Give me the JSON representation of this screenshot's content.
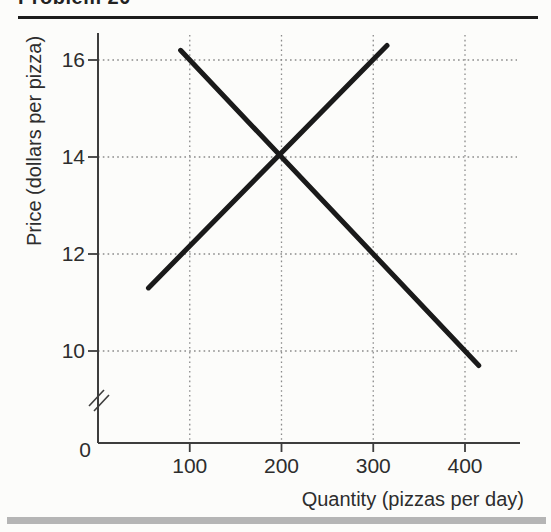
{
  "page": {
    "heading_clipped": "Problem 20",
    "top_rule_color": "#1c1c1c",
    "bottom_bar_color": "#b5b5b5",
    "background_color": "#fcfcfa"
  },
  "chart_data": {
    "type": "line",
    "title": "",
    "xlabel": "Quantity (pizzas per day)",
    "ylabel": "Price (dollars per pizza)",
    "x_ticks": [
      100,
      200,
      300,
      400
    ],
    "y_ticks": [
      16,
      14,
      12,
      10
    ],
    "origin_label": "0",
    "xlim": [
      0,
      455
    ],
    "ylim": [
      9,
      16.5
    ],
    "y_axis_break": true,
    "grid": "dotted",
    "grid_color": "#8a8a8a",
    "axis_color": "#3d3d3d",
    "line_color": "#1a1a1a",
    "series": [
      {
        "name": "demand",
        "points": [
          [
            90,
            16.2
          ],
          [
            415,
            9.7
          ]
        ]
      },
      {
        "name": "supply",
        "points": [
          [
            55,
            11.3
          ],
          [
            315,
            16.3
          ]
        ]
      }
    ],
    "equilibrium": {
      "quantity": 200,
      "price": 14
    }
  }
}
